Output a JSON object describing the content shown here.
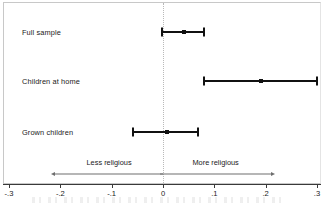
{
  "chart_data": {
    "type": "scatter",
    "subtype": "forest-plot",
    "title": "",
    "subtitle": "",
    "xlabel": "",
    "ylabel": "",
    "xlim": [
      -0.3,
      0.3
    ],
    "grid": false,
    "legend": "none",
    "zero_reference_line": 0,
    "xticks": [
      -0.3,
      -0.2,
      -0.1,
      0,
      0.1,
      0.2,
      0.3
    ],
    "xticklabels": [
      "-.3",
      "-.2",
      "-.1",
      "0",
      ".1",
      ".2",
      ".3"
    ],
    "categories": [
      "Full sample",
      "Children at home",
      "Grown children"
    ],
    "values": [
      0.04,
      0.19,
      0.008
    ],
    "ci_low": [
      -0.001,
      0.08,
      -0.058
    ],
    "ci_high": [
      0.079,
      0.3,
      0.068
    ],
    "points": [
      {
        "label": "Full sample",
        "estimate": 0.04,
        "ci_low": -0.001,
        "ci_high": 0.079
      },
      {
        "label": "Children at home",
        "estimate": 0.19,
        "ci_low": 0.08,
        "ci_high": 0.3
      },
      {
        "label": "Grown children",
        "estimate": 0.008,
        "ci_low": -0.058,
        "ci_high": 0.068
      }
    ],
    "annotations": [
      {
        "text": "Less religious",
        "direction": "left",
        "from": 0.0,
        "to": -0.21
      },
      {
        "text": "More religious",
        "direction": "right",
        "from": -0.005,
        "to": 0.21
      }
    ],
    "colors": {
      "marker": "#111111",
      "error_bar": "#111111",
      "zero_line": "#b9b9b9",
      "annotation_arrow": "#6e6e6e",
      "axis": "#3a3a3a",
      "frame": "#c8c8c8",
      "background": "#ffffff"
    }
  },
  "rows": [
    {
      "label": "Full sample"
    },
    {
      "label": "Children at home"
    },
    {
      "label": "Grown children"
    }
  ],
  "annotations": [
    {
      "label": "Less religious"
    },
    {
      "label": "More religious"
    }
  ],
  "axis": {
    "ticks": [
      {
        "label": "-.3"
      },
      {
        "label": "-.2"
      },
      {
        "label": "-.1"
      },
      {
        "label": "0"
      },
      {
        "label": ".1"
      },
      {
        "label": ".2"
      },
      {
        "label": ".3"
      }
    ]
  }
}
